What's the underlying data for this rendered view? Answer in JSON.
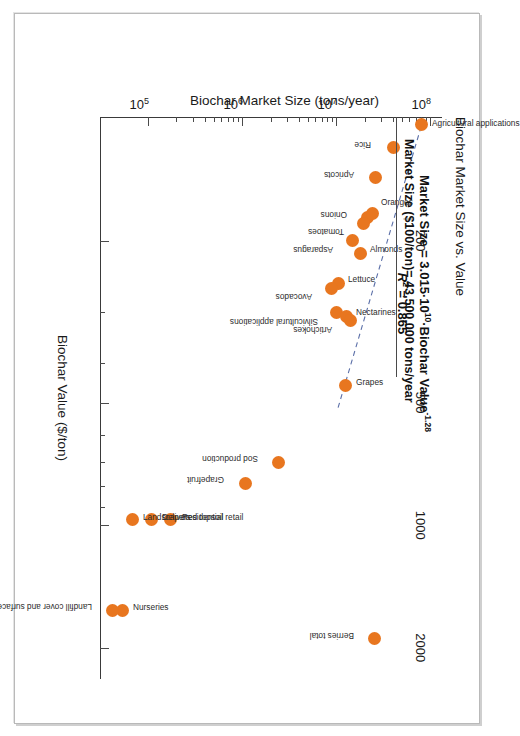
{
  "figure": {
    "title": "Biochar Market Size vs. Value",
    "equation_line1_prefix": "Market Size = 3.015",
    "equation_mid": "10",
    "equation_exp1": "10",
    "equation_line1_suffix": "Biochar Value",
    "equation_exp2": "-1.28",
    "r2_label": "R",
    "r2_exp": "2",
    "r2_value": "= 0.865",
    "callout": "Market Size ($100/ton)= 43,500,000 tons/year",
    "orange": "#e8761f",
    "fit_color": "#5b6fa8"
  },
  "chart_data": {
    "type": "scatter",
    "title": "Biochar Market Size vs. Value",
    "xlabel": "Biochar Value ($/ton)",
    "ylabel": "Biochar Market Size (tons/year)",
    "xscale": "log",
    "yscale": "log",
    "xlim": [
      100,
      2400
    ],
    "ylim": [
      30000,
      130000000
    ],
    "grid": false,
    "legend": "none",
    "xticks_major": [
      200,
      500,
      1000,
      2000
    ],
    "xtick_labels": [
      "200",
      "500",
      "1000",
      "2000"
    ],
    "yticks_major": [
      100000000,
      10000000,
      1000000,
      100000
    ],
    "ytick_labels": [
      "10",
      "10",
      "10",
      "10"
    ],
    "ytick_exponents": [
      "8",
      "7",
      "6",
      "5"
    ],
    "fit": {
      "equation": "Market Size = 3.015*10^10 * Biochar Value^-1.28",
      "r_squared": 0.865,
      "style": "dashed",
      "x_start": 105,
      "x_end": 520
    },
    "points": [
      {
        "label": "Rice",
        "x": 118,
        "y": 40000000,
        "lx": -2,
        "ly": 18,
        "rot": 90
      },
      {
        "label": "Agricultural applications",
        "x": 104,
        "y": 78000000,
        "lx": -2,
        "ly": -16,
        "rot": -90
      },
      {
        "label": "Apricots",
        "x": 140,
        "y": 25500000,
        "lx": -3,
        "ly": 16,
        "rot": 90
      },
      {
        "label": "Onions",
        "x": 176,
        "y": 21000000,
        "lx": -3,
        "ly": 16,
        "rot": 90
      },
      {
        "label": "Tomatoes",
        "x": 182,
        "y": 19000000,
        "lx": 8,
        "ly": 14,
        "rot": 90
      },
      {
        "label": "Oranges",
        "x": 172,
        "y": 23500000,
        "lx": -12,
        "ly": -14,
        "rot": -90
      },
      {
        "label": "Asparagus",
        "x": 200,
        "y": 14500000,
        "lx": 9,
        "ly": 14,
        "rot": 90
      },
      {
        "label": "Almonds",
        "x": 215,
        "y": 17500000,
        "lx": -4,
        "ly": -15,
        "rot": -90
      },
      {
        "label": "Lettuce",
        "x": 255,
        "y": 10300000,
        "lx": -5,
        "ly": -15,
        "rot": -90
      },
      {
        "label": "Avocados",
        "x": 262,
        "y": 8600000,
        "lx": 9,
        "ly": 14,
        "rot": 90
      },
      {
        "label": "Silvicultural applications",
        "x": 300,
        "y": 9900000,
        "lx": 10,
        "ly": 14,
        "rot": 90
      },
      {
        "label": "Nectarines",
        "x": 307,
        "y": 12400000,
        "lx": -4,
        "ly": -15,
        "rot": -90
      },
      {
        "label": "Artichokes",
        "x": 315,
        "y": 13800000,
        "lx": 9,
        "ly": 13,
        "rot": 90
      },
      {
        "label": "Grapes",
        "x": 455,
        "y": 12300000,
        "lx": -4,
        "ly": -15,
        "rot": -90
      },
      {
        "label": "Grapefruit",
        "x": 790,
        "y": 1050000,
        "lx": -3,
        "ly": 16,
        "rot": 90
      },
      {
        "label": "Sod production",
        "x": 700,
        "y": 2400000,
        "lx": -3,
        "ly": 16,
        "rot": 90
      },
      {
        "label": "Berries total",
        "x": 1900,
        "y": 25000000,
        "lx": -3,
        "ly": 16,
        "rot": 90
      },
      {
        "label": "Residential retail",
        "x": 970,
        "y": 170000,
        "lx": -3,
        "ly": -16,
        "rot": -90
      },
      {
        "label": "Delivered topsoil",
        "x": 970,
        "y": 105000,
        "lx": -3,
        "ly": -16,
        "rot": -90
      },
      {
        "label": "Landscapers",
        "x": 970,
        "y": 66000,
        "lx": -3,
        "ly": -16,
        "rot": -90
      },
      {
        "label": "Nurseries",
        "x": 1620,
        "y": 52000,
        "lx": -3,
        "ly": -16,
        "rot": -90
      },
      {
        "label": "Landfill cover and surface mine reclamation",
        "x": 1620,
        "y": 41000,
        "lx": -3,
        "ly": 16,
        "rot": 90
      }
    ]
  }
}
